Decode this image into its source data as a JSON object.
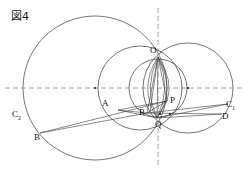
{
  "figure": {
    "caption": "図4",
    "background_color": "#ffffff",
    "stroke_color": "#3a3a3a",
    "dash_color": "#8a8a8a",
    "width": 248,
    "height": 173
  },
  "axes": {
    "horizontal": {
      "label": "horizontal-axis",
      "y": 88,
      "x1": 5,
      "x2": 243
    },
    "vertical": {
      "label": "vertical-axis",
      "x": 158,
      "y1": 8,
      "y2": 168
    }
  },
  "circles": [
    {
      "name": "circle-large-left",
      "cx": 95,
      "cy": 88,
      "r": 72,
      "center_dot": true
    },
    {
      "name": "circle-middle",
      "cx": 140,
      "cy": 88,
      "r": 42,
      "center_dot": false
    },
    {
      "name": "circle-right",
      "cx": 188,
      "cy": 88,
      "r": 45,
      "center_dot": true
    },
    {
      "name": "circle-small-inner",
      "cx": 158,
      "cy": 88,
      "r": 29,
      "center_dot": false
    }
  ],
  "points": [
    {
      "name": "point-O",
      "label": "O",
      "x": 158,
      "y": 57,
      "lx": 150,
      "ly": 46
    },
    {
      "name": "point-P",
      "label": "P",
      "x": 167,
      "y": 101,
      "lx": 170,
      "ly": 96
    },
    {
      "name": "point-Q",
      "label": "Q",
      "x": 157,
      "y": 118,
      "lx": 155,
      "ly": 120
    },
    {
      "name": "point-R",
      "label": "R",
      "x": 147,
      "y": 113,
      "lx": 139,
      "ly": 108
    },
    {
      "name": "point-A",
      "label": "A",
      "x": 118,
      "y": 110,
      "lx": 102,
      "ly": 99
    },
    {
      "name": "point-B",
      "label": "B",
      "x": 40,
      "y": 133,
      "lx": 34,
      "ly": 133
    },
    {
      "name": "point-D",
      "label": "D",
      "x": 222,
      "y": 114,
      "lx": 222,
      "ly": 112
    },
    {
      "name": "point-C1",
      "label": "C",
      "sub": "1",
      "x": 228,
      "y": 104,
      "lx": 226,
      "ly": 100
    },
    {
      "name": "point-C2",
      "label": "C",
      "sub": "2",
      "x": 22,
      "y": 113,
      "lx": 12,
      "ly": 110
    }
  ],
  "segments": [
    {
      "name": "segment-O-R",
      "x1": 158,
      "y1": 57,
      "x2": 147,
      "y2": 113
    },
    {
      "name": "segment-O-Q",
      "x1": 158,
      "y1": 57,
      "x2": 157,
      "y2": 118
    },
    {
      "name": "segment-O-P",
      "x1": 158,
      "y1": 57,
      "x2": 167,
      "y2": 101
    },
    {
      "name": "segment-O-A-chord",
      "x1": 158,
      "y1": 57,
      "x2": 150,
      "y2": 112
    },
    {
      "name": "segment-B-P",
      "x1": 40,
      "y1": 133,
      "x2": 167,
      "y2": 101
    },
    {
      "name": "segment-B-R",
      "x1": 40,
      "y1": 133,
      "x2": 147,
      "y2": 113
    },
    {
      "name": "segment-A-P",
      "x1": 118,
      "y1": 110,
      "x2": 167,
      "y2": 101
    },
    {
      "name": "segment-A-R",
      "x1": 118,
      "y1": 110,
      "x2": 147,
      "y2": 113
    },
    {
      "name": "segment-R-D",
      "x1": 147,
      "y1": 113,
      "x2": 222,
      "y2": 114
    },
    {
      "name": "segment-R-C1",
      "x1": 147,
      "y1": 113,
      "x2": 228,
      "y2": 104
    },
    {
      "name": "segment-Q-C1",
      "x1": 157,
      "y1": 118,
      "x2": 228,
      "y2": 104
    },
    {
      "name": "segment-Q-D",
      "x1": 157,
      "y1": 118,
      "x2": 222,
      "y2": 114
    },
    {
      "name": "segment-P-Q",
      "x1": 167,
      "y1": 101,
      "x2": 157,
      "y2": 118
    },
    {
      "name": "segment-P-R",
      "x1": 167,
      "y1": 101,
      "x2": 147,
      "y2": 113
    },
    {
      "name": "segment-A-Q",
      "x1": 118,
      "y1": 110,
      "x2": 157,
      "y2": 118
    }
  ],
  "arcs": [
    {
      "name": "arc-O-to-Q-left",
      "d": "M 158 57 Q 138 88 157 118"
    },
    {
      "name": "arc-O-to-Q-inner-left",
      "d": "M 158 57 Q 143 88 157 118"
    },
    {
      "name": "arc-O-to-Q-inner-right",
      "d": "M 158 57 Q 172 88 157 118"
    },
    {
      "name": "arc-O-to-Q-right",
      "d": "M 158 57 Q 176 90 157 118"
    },
    {
      "name": "arc-O-to-P-bulge",
      "d": "M 158 57 Q 174 80 167 101"
    }
  ],
  "small_dots": [
    {
      "name": "dot-center-left-circle",
      "x": 95,
      "y": 88
    },
    {
      "name": "dot-center-right-circle",
      "x": 188,
      "y": 88
    },
    {
      "name": "dot-near-Q",
      "x": 160,
      "y": 114
    },
    {
      "name": "dot-right-of-Q",
      "x": 170,
      "y": 114
    }
  ]
}
